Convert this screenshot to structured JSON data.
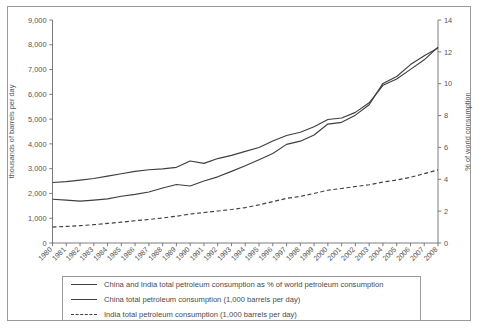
{
  "chart_data": {
    "type": "line",
    "title": "",
    "xlabel": "",
    "ylabel": "thousands of barrels per day",
    "y2label": "% of world consumption",
    "ylim": [
      0,
      9000
    ],
    "y2lim": [
      0,
      14
    ],
    "grid": false,
    "legend_position": "bottom",
    "yticks": [
      "0",
      "1,000",
      "2,000",
      "3,000",
      "4,000",
      "5,000",
      "6,000",
      "7,000",
      "8,000",
      "9,000"
    ],
    "y2ticks": [
      "0",
      "2",
      "4",
      "6",
      "8",
      "10",
      "12",
      "14"
    ],
    "categories": [
      1980,
      1981,
      1982,
      1983,
      1984,
      1985,
      1986,
      1987,
      1988,
      1989,
      1990,
      1991,
      1992,
      1993,
      1994,
      1995,
      1996,
      1997,
      1998,
      1999,
      2000,
      2001,
      2002,
      2003,
      2004,
      2005,
      2006,
      2007,
      2008
    ],
    "series": [
      {
        "name": "China and India total petroleum consumption as % of world petroleum consumption",
        "axis": "right",
        "style": "solid",
        "unit": "%",
        "values": [
          3.8,
          3.85,
          3.95,
          4.05,
          4.2,
          4.35,
          4.5,
          4.6,
          4.65,
          4.75,
          5.15,
          5.0,
          5.3,
          5.5,
          5.75,
          6.0,
          6.4,
          6.75,
          6.95,
          7.3,
          7.75,
          7.85,
          8.2,
          8.8,
          9.9,
          10.3,
          10.9,
          11.5,
          12.3
        ]
      },
      {
        "name": "China total petroleum consumption (1,000 barrels per day)",
        "axis": "left",
        "style": "solid",
        "unit": "thousands of barrels per day",
        "values": [
          1765,
          1730,
          1690,
          1730,
          1780,
          1885,
          1965,
          2060,
          2220,
          2360,
          2300,
          2500,
          2670,
          2890,
          3120,
          3360,
          3610,
          3980,
          4110,
          4360,
          4800,
          4870,
          5160,
          5580,
          6440,
          6720,
          7200,
          7560,
          7870
        ]
      },
      {
        "name": "India total petroleum consumption (1,000 barrels per day)",
        "axis": "left",
        "style": "dashed",
        "unit": "thousands of barrels per day",
        "values": [
          640,
          670,
          700,
          740,
          790,
          840,
          900,
          950,
          1010,
          1080,
          1170,
          1230,
          1290,
          1350,
          1430,
          1540,
          1670,
          1800,
          1880,
          2000,
          2130,
          2200,
          2280,
          2350,
          2460,
          2540,
          2650,
          2800,
          2950
        ]
      }
    ]
  },
  "legend": {
    "items": [
      {
        "label": "China and India total petroleum consumption as % of world petroleum consumption",
        "style": "solid"
      },
      {
        "label": "China total petroleum consumption (1,000 barrels per day)",
        "style": "solid"
      },
      {
        "label": "India total petroleum consumption (1,000 barrels per day)",
        "style": "dashed"
      }
    ]
  }
}
